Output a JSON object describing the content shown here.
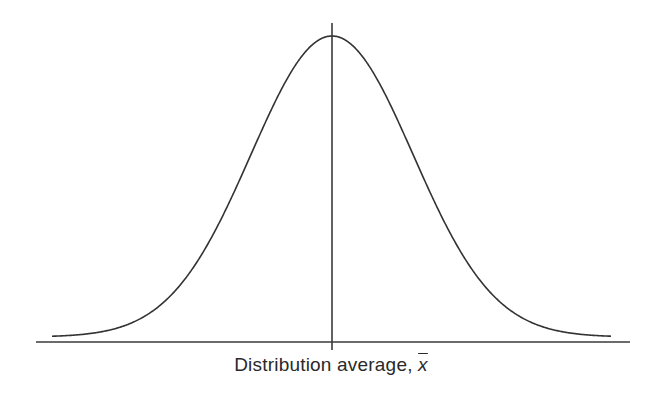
{
  "chart_data": {
    "type": "line",
    "title": "",
    "xlabel": "Distribution average, x̄",
    "xlabel_prefix": "Distribution average, ",
    "xlabel_symbol": "x",
    "ylabel": "",
    "grid": false,
    "legend": null,
    "series": [
      {
        "name": "normal distribution",
        "shape": "gaussian",
        "mean_marker": "vertical line at distribution average",
        "x_sigma": [
          -3.5,
          -3,
          -2.5,
          -2,
          -1.5,
          -1,
          -0.5,
          0,
          0.5,
          1,
          1.5,
          2,
          2.5,
          3,
          3.5
        ],
        "y_relative": [
          0.002,
          0.011,
          0.044,
          0.135,
          0.325,
          0.607,
          0.882,
          1.0,
          0.882,
          0.607,
          0.325,
          0.135,
          0.044,
          0.011,
          0.002
        ]
      }
    ],
    "colors": {
      "line": "#333333",
      "background": "#ffffff"
    }
  }
}
